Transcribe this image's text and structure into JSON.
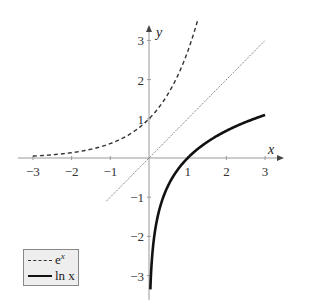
{
  "chart_data": {
    "type": "line",
    "title": "",
    "xlabel": "x",
    "ylabel": "y",
    "xlim": [
      -3.2,
      3.3
    ],
    "ylim": [
      -3.4,
      3.5
    ],
    "x_ticks": [
      "-3",
      "-2",
      "-1",
      "1",
      "2",
      "3"
    ],
    "y_ticks": [
      "3",
      "2",
      "1",
      "-1",
      "-2",
      "-3"
    ],
    "grid": false,
    "legend_position": "lower left",
    "series": [
      {
        "name": "e^x",
        "style": "dashed",
        "color": "#333333",
        "x_range": [
          -3,
          1.25
        ],
        "function": "exp(x)"
      },
      {
        "name": "ln x",
        "style": "solid-thick",
        "color": "#111111",
        "x_range": [
          0.035,
          3
        ],
        "function": "ln(x)"
      },
      {
        "name": "y = x",
        "style": "dotted",
        "color": "#555555",
        "x_range": [
          -1.1,
          3
        ],
        "function": "x"
      }
    ]
  },
  "axes": {
    "x_label": "x",
    "y_label": "y"
  },
  "legend": {
    "items": [
      {
        "label": "e",
        "sup": "x"
      },
      {
        "label": "ln x"
      }
    ]
  }
}
